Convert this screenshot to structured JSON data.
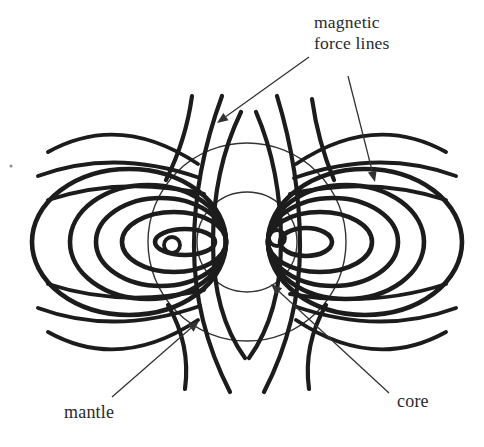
{
  "labels": {
    "magnetic_force_lines": "magnetic\nforce lines",
    "mantle": "mantle",
    "core": "core"
  },
  "diagram": {
    "canvas": {
      "width": 484,
      "height": 447
    },
    "colors": {
      "background": "#ffffff",
      "ink": "#1c1c1c",
      "thin_ink": "#333333",
      "text": "#2a2a2a",
      "speck": "#8a8a8a"
    },
    "stroke": {
      "loop": 4.6,
      "open": 4.2,
      "wing": 3.9,
      "swirl": 3.8,
      "circle": 1.4,
      "arrow": 1.3
    },
    "arrow_head": {
      "length": 11,
      "half_width": 4.5
    },
    "circles": [
      {
        "name": "mantle-boundary-circle",
        "cx": 247,
        "cy": 242,
        "r": 99
      },
      {
        "name": "core-boundary-circle",
        "cx": 247,
        "cy": 242,
        "r": 50
      }
    ],
    "loops": [
      {
        "name": "left-field-loop-1",
        "cx": 129,
        "cy": 242,
        "rx": 97,
        "ry": 73
      },
      {
        "name": "left-field-loop-2",
        "cx": 148,
        "cy": 242,
        "rx": 78,
        "ry": 57
      },
      {
        "name": "left-field-loop-3",
        "cx": 161,
        "cy": 242,
        "rx": 65,
        "ry": 44
      },
      {
        "name": "left-field-loop-4",
        "cx": 174,
        "cy": 242,
        "rx": 52,
        "ry": 30
      },
      {
        "name": "left-field-loop-5",
        "cx": 185,
        "cy": 242,
        "rx": 30,
        "ry": 13
      },
      {
        "name": "right-field-loop-1",
        "cx": 365,
        "cy": 242,
        "rx": 97,
        "ry": 73
      },
      {
        "name": "right-field-loop-2",
        "cx": 346,
        "cy": 242,
        "rx": 78,
        "ry": 57
      },
      {
        "name": "right-field-loop-3",
        "cx": 333,
        "cy": 242,
        "rx": 65,
        "ry": 44
      },
      {
        "name": "right-field-loop-4",
        "cx": 320,
        "cy": 242,
        "rx": 52,
        "ry": 30
      },
      {
        "name": "right-field-loop-5",
        "cx": 306,
        "cy": 242,
        "rx": 26,
        "ry": 14
      }
    ],
    "swirls": [
      {
        "name": "left-field-swirl",
        "cx": 172,
        "cy": 245,
        "r": 8
      },
      {
        "name": "right-field-swirl",
        "cx": 277,
        "cy": 238,
        "r": 8
      }
    ],
    "open_lines": [
      {
        "name": "left-inner-polar-field-line",
        "d": "M241,112 Q213,170 213,242 Q213,314 245,358"
      },
      {
        "name": "left-outer-polar-field-line",
        "d": "M222,96 Q194,172 194,246 Q194,322 230,392"
      },
      {
        "name": "right-inner-polar-field-line",
        "d": "M256,112 Q281,170 281,242 Q281,314 249,358"
      },
      {
        "name": "right-outer-polar-field-line",
        "d": "M277,96 Q300,172 300,246 Q300,322 264,392"
      },
      {
        "name": "upper-left-field-line",
        "d": "M192,96 Q186,140 166,180"
      },
      {
        "name": "lower-left-field-line",
        "d": "M185,389 Q191,345 168,305"
      },
      {
        "name": "upper-right-field-line",
        "d": "M312,99 Q318,142 334,180"
      },
      {
        "name": "lower-right-field-line",
        "d": "M309,389 Q303,345 326,305"
      }
    ],
    "wing_lines": [
      {
        "name": "upper-left-wing-arc-1",
        "d": "M48,152 Q120,112 198,164"
      },
      {
        "name": "upper-left-wing-arc-2",
        "d": "M38,176 Q114,148 200,178"
      },
      {
        "name": "upper-left-wing-arc-3",
        "d": "M48,200 Q122,176 204,194"
      },
      {
        "name": "lower-left-wing-arc-1",
        "d": "M48,332 Q120,372 198,320"
      },
      {
        "name": "lower-left-wing-arc-2",
        "d": "M38,308 Q114,336 200,306"
      },
      {
        "name": "lower-left-wing-arc-3",
        "d": "M48,284 Q122,308 204,290"
      },
      {
        "name": "upper-right-wing-arc-1",
        "d": "M446,152 Q374,112 296,164"
      },
      {
        "name": "upper-right-wing-arc-2",
        "d": "M456,176 Q380,148 294,178"
      },
      {
        "name": "upper-right-wing-arc-3",
        "d": "M446,200 Q372,176 290,194"
      },
      {
        "name": "lower-right-wing-arc-1",
        "d": "M446,332 Q374,372 296,320"
      },
      {
        "name": "lower-right-wing-arc-2",
        "d": "M456,308 Q380,336 294,306"
      },
      {
        "name": "lower-right-wing-arc-3",
        "d": "M446,284 Q372,308 290,294"
      }
    ],
    "arrows": [
      {
        "name": "magnetic-force-lines-arrow-left",
        "x1": 309,
        "y1": 57,
        "x2": 217,
        "y2": 123
      },
      {
        "name": "magnetic-force-lines-arrow-right",
        "x1": 348,
        "y1": 76,
        "x2": 375,
        "y2": 182
      },
      {
        "name": "mantle-arrow",
        "x1": 112,
        "y1": 397,
        "x2": 199,
        "y2": 321
      },
      {
        "name": "core-arrow",
        "x1": 389,
        "y1": 393,
        "x2": 271,
        "y2": 284
      }
    ],
    "speck": {
      "cx": 11,
      "cy": 166,
      "r": 1.5
    }
  }
}
